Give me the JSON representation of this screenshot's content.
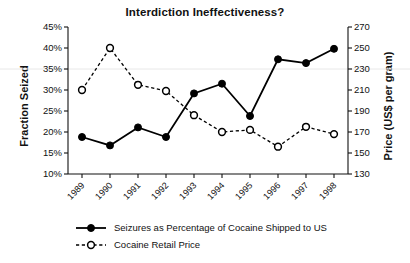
{
  "chart_data": {
    "type": "line",
    "title": "Interdiction Ineffectiveness?",
    "xlabel": "",
    "ylabel": "Fraction Seized",
    "ylabel_right": "Price (US$ per gram)",
    "categories": [
      "1989",
      "1990",
      "1991",
      "1992",
      "1993",
      "1994",
      "1995",
      "1996",
      "1997",
      "1998"
    ],
    "ylim": [
      10,
      45
    ],
    "ylim_right": [
      130,
      270
    ],
    "yticks": [
      "10%",
      "15%",
      "20%",
      "25%",
      "30%",
      "35%",
      "40%",
      "45%"
    ],
    "ytick_values": [
      10,
      15,
      20,
      25,
      30,
      35,
      40,
      45
    ],
    "yticks_right": [
      "130",
      "150",
      "170",
      "190",
      "210",
      "230",
      "250",
      "270"
    ],
    "ytick_values_right": [
      130,
      150,
      170,
      190,
      210,
      230,
      250,
      270
    ],
    "grid": false,
    "legend_position": "bottom-left",
    "series": [
      {
        "name": "Seizures as Percentage of Cocaine Shipped to US",
        "axis": "left",
        "marker": "filled-circle",
        "linestyle": "solid",
        "color": "#000000",
        "values": [
          18.8,
          16.8,
          21.1,
          18.8,
          29.2,
          31.5,
          23.8,
          37.3,
          36.4,
          39.8
        ]
      },
      {
        "name": "Cocaine Retail Price",
        "axis": "right",
        "marker": "open-circle",
        "linestyle": "dashed",
        "color": "#000000",
        "values": [
          210,
          250,
          215,
          209,
          186,
          170,
          172,
          156,
          175,
          168
        ]
      }
    ]
  },
  "legend": {
    "items": [
      {
        "label": "Seizures as Percentage of Cocaine Shipped to US",
        "marker": "filled-circle",
        "linestyle": "solid"
      },
      {
        "label": "Cocaine Retail Price",
        "marker": "open-circle",
        "linestyle": "dashed"
      }
    ]
  }
}
